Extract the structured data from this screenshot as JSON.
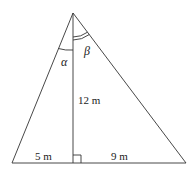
{
  "diagram": {
    "labels": {
      "height": "12 m",
      "left_base": "5 m",
      "right_base": "9 m",
      "alpha": "α",
      "beta": "β"
    },
    "stroke_color": "#333333"
  }
}
